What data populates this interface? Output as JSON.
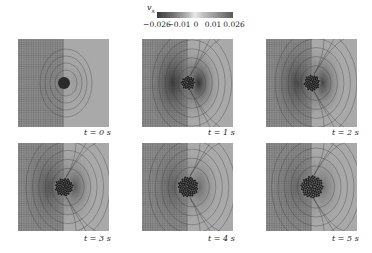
{
  "colorbar": {
    "variable": "v",
    "subscript": "x",
    "ticks": [
      "−0.026",
      "−0.01",
      "0",
      "0.01",
      "0.026"
    ],
    "range": [
      -0.026,
      0.026
    ]
  },
  "panels": [
    {
      "label": "t = 0 s",
      "time": 0,
      "particles": 30,
      "intensity": 0.25
    },
    {
      "label": "t = 1 s",
      "time": 1,
      "particles": 40,
      "intensity": 1.0
    },
    {
      "label": "t = 2 s",
      "time": 2,
      "particles": 55,
      "intensity": 0.9
    },
    {
      "label": "t = 3 s",
      "time": 3,
      "particles": 70,
      "intensity": 0.8
    },
    {
      "label": "t = 4 s",
      "time": 4,
      "particles": 85,
      "intensity": 0.7
    },
    {
      "label": "t = 5 s",
      "time": 5,
      "particles": 95,
      "intensity": 0.65
    }
  ]
}
